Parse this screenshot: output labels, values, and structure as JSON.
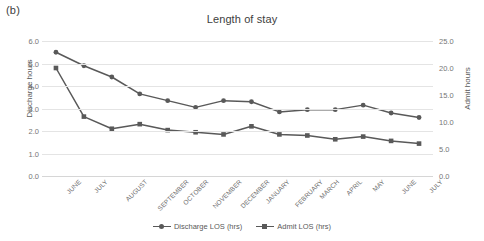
{
  "panel_label": "(b)",
  "axes": {
    "left_title": "Discharge hours",
    "right_title": "Admit hours",
    "left_ticks": [
      "0.0",
      "1.0",
      "2.0",
      "3.0",
      "4.0",
      "5.0",
      "6.0"
    ],
    "right_ticks": [
      "0.0",
      "5.0",
      "10.0",
      "15.0",
      "20.0",
      "25.0"
    ]
  },
  "legend": {
    "items": [
      {
        "label": "Discharge LOS (hrs)",
        "marker": "circle-marker",
        "color": "#595959"
      },
      {
        "label": "Admit LOS (hrs)",
        "marker": "square-marker",
        "color": "#595959"
      }
    ]
  },
  "chart_data": {
    "type": "line",
    "title": "Length of stay",
    "xlabel": "",
    "ylabel": "Discharge hours",
    "y2label": "Admit hours",
    "ylim": [
      0.0,
      6.0
    ],
    "y2lim": [
      0.0,
      25.0
    ],
    "ytick_step": 1.0,
    "y2tick_step": 5.0,
    "grid": true,
    "legend_position": "bottom",
    "categories": [
      "JUNE",
      "JULY",
      "AUGUST",
      "SEPTEMBER",
      "OCTOBER",
      "NOVEMBER",
      "DECEMBER",
      "JANUARY",
      "FEBRUARY",
      "MARCH",
      "APRIL",
      "MAY",
      "JUNE",
      "JULY"
    ],
    "series": [
      {
        "name": "Discharge LOS (hrs)",
        "axis": "left",
        "units": "hrs",
        "color": "#595959",
        "marker": "circle",
        "values": [
          5.5,
          4.9,
          4.4,
          3.65,
          3.35,
          3.05,
          3.35,
          3.3,
          2.85,
          2.95,
          2.95,
          3.15,
          2.8,
          2.6
        ]
      },
      {
        "name": "Admit LOS (hrs)",
        "axis": "right",
        "units": "hrs",
        "color": "#595959",
        "marker": "square",
        "values": [
          20.0,
          11.0,
          8.75,
          9.6,
          8.5,
          8.1,
          7.7,
          9.2,
          7.7,
          7.5,
          6.8,
          7.3,
          6.5,
          6.0
        ]
      }
    ]
  }
}
